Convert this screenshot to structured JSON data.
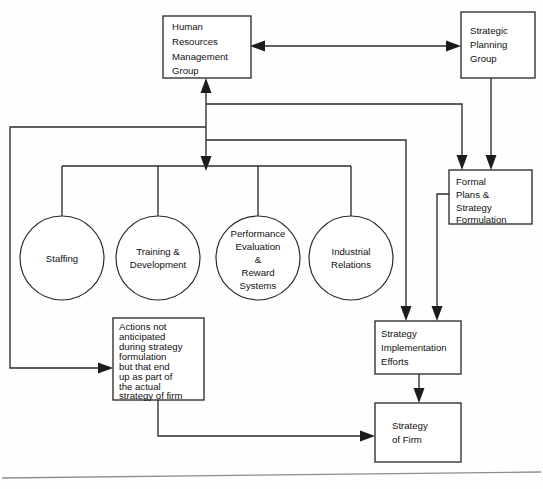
{
  "diagram": {
    "type": "flowchart",
    "colors": {
      "stroke": "#2b2b2b",
      "fill": "#ffffff",
      "text": "#111111",
      "rule": "#8d8d8d"
    },
    "boxes": [
      {
        "id": "hrm-group",
        "label": "Human Resources Management Group",
        "lines": [
          "Human",
          "Resources",
          "Management",
          "Group"
        ]
      },
      {
        "id": "strategic-planning-group",
        "label": "Strategic Planning Group",
        "lines": [
          "Strategic",
          "Planning",
          "Group"
        ]
      },
      {
        "id": "formal-plans",
        "label": "Formal Plans & Strategy Formulation",
        "lines": [
          "Formal",
          "Plans &",
          "Strategy",
          "Formulation"
        ]
      },
      {
        "id": "unanticipated-actions",
        "label": "Actions not anticipated during strategy formulation but that end up as part of the actual strategy of firm",
        "lines": [
          "Actions not",
          "anticipated",
          "during strategy",
          "formulation",
          "but that end",
          "up as part of",
          "the actual",
          "strategy of firm"
        ]
      },
      {
        "id": "strategy-implementation",
        "label": "Strategy Implementation Efforts",
        "lines": [
          "Strategy",
          "Implementation",
          "Efforts"
        ]
      },
      {
        "id": "strategy-of-firm",
        "label": "Strategy of Firm",
        "lines": [
          "Strategy",
          "of Firm"
        ]
      }
    ],
    "circles": [
      {
        "id": "staffing",
        "label": "Staffing",
        "lines": [
          "Staffing"
        ]
      },
      {
        "id": "training-development",
        "label": "Training & Development",
        "lines": [
          "Training &",
          "Development"
        ]
      },
      {
        "id": "performance-evaluation",
        "label": "Performance Evaluation & Reward Systems",
        "lines": [
          "Performance",
          "Evaluation",
          "&",
          "Reward",
          "Systems"
        ]
      },
      {
        "id": "industrial-relations",
        "label": "Industrial Relations",
        "lines": [
          "Industrial",
          "Relations"
        ]
      }
    ],
    "connections": [
      {
        "id": "hrm-to-spg",
        "from": "hrm-group",
        "to": "strategic-planning-group",
        "style": "double-arrow"
      },
      {
        "id": "spg-to-formal-plans",
        "from": "strategic-planning-group",
        "to": "formal-plans",
        "style": "arrow"
      },
      {
        "id": "hrm-to-formal-plans",
        "from": "hrm-group",
        "to": "formal-plans",
        "style": "arrow"
      },
      {
        "id": "hrm-to-functions",
        "from": "hrm-group",
        "to": "hr-functions-bar",
        "style": "arrow"
      },
      {
        "id": "functions-to-hrm",
        "from": "hr-functions-bar",
        "to": "hrm-group",
        "style": "arrow"
      },
      {
        "id": "functions-to-implementation",
        "from": "hr-functions-bar",
        "to": "strategy-implementation",
        "style": "arrow"
      },
      {
        "id": "formal-plans-to-implementation",
        "from": "formal-plans",
        "to": "strategy-implementation",
        "style": "arrow"
      },
      {
        "id": "trunk-to-unanticipated",
        "from": "hrm-trunk",
        "to": "unanticipated-actions",
        "style": "arrow"
      },
      {
        "id": "implementation-to-strategy",
        "from": "strategy-implementation",
        "to": "strategy-of-firm",
        "style": "arrow"
      },
      {
        "id": "unanticipated-to-strategy",
        "from": "unanticipated-actions",
        "to": "strategy-of-firm",
        "style": "arrow"
      }
    ]
  }
}
